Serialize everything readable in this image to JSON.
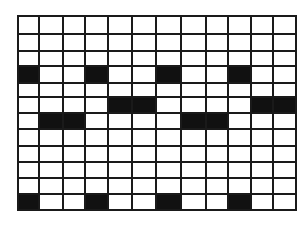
{
  "diagram": {
    "type": "grid-pattern",
    "rows": 12,
    "cols": 12,
    "col_edges": [
      18,
      39,
      63,
      85,
      108,
      132,
      156,
      181,
      206,
      228,
      251,
      273,
      296
    ],
    "row_edges": [
      16,
      34,
      51,
      66,
      83,
      97,
      113,
      129,
      146,
      162,
      178,
      194,
      210
    ],
    "line_color": "#1a1a1a",
    "fill_color": "#111111",
    "empty_color": "#ffffff",
    "filled_cells": [
      [
        3,
        0
      ],
      [
        3,
        3
      ],
      [
        3,
        6
      ],
      [
        3,
        9
      ],
      [
        5,
        4
      ],
      [
        5,
        5
      ],
      [
        5,
        10
      ],
      [
        5,
        11
      ],
      [
        6,
        1
      ],
      [
        6,
        2
      ],
      [
        6,
        7
      ],
      [
        6,
        8
      ],
      [
        11,
        0
      ],
      [
        11,
        3
      ],
      [
        11,
        6
      ],
      [
        11,
        9
      ]
    ]
  }
}
